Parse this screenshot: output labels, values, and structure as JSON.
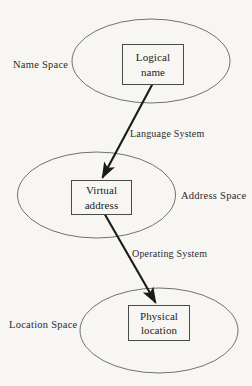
{
  "diagram": {
    "background_color": "#f7f6f2",
    "stroke_color": "#4a4a48",
    "arrow_color": "#1a1a1a",
    "spaces": [
      {
        "id": "name-space",
        "label": "Name Space",
        "node": {
          "line1": "Logical",
          "line2": "name"
        }
      },
      {
        "id": "address-space",
        "label": "Address Space",
        "node": {
          "line1": "Virtual",
          "line2": "address"
        }
      },
      {
        "id": "location-space",
        "label": "Location Space",
        "node": {
          "line1": "Physical",
          "line2": "location"
        }
      }
    ],
    "mappings": [
      {
        "id": "language-system",
        "label": "Language System",
        "from": "Logical name",
        "to": "Virtual address"
      },
      {
        "id": "operating-system",
        "label": "Operating System",
        "from": "Virtual address",
        "to": "Physical location"
      }
    ]
  }
}
